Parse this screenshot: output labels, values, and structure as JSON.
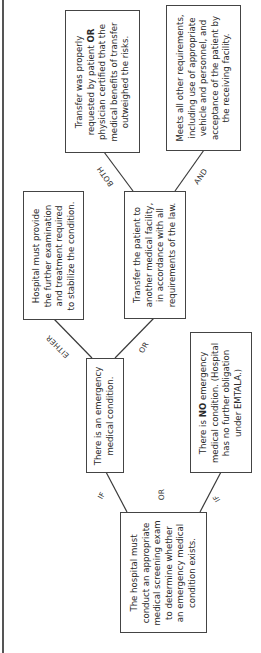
{
  "diagram": {
    "orientation": "rotated -90deg (reads bottom-to-top)",
    "nodes": {
      "screening": {
        "lines": [
          "The hospital must",
          "conduct an appropriate",
          "medical screening exam",
          "to determine whether",
          "an emergency medical",
          "condition exists."
        ]
      },
      "emergency": {
        "lines": [
          "There is an emergency",
          "medical condition."
        ]
      },
      "no_emergency": {
        "line1_pre": "There is ",
        "line1_bold": "NO",
        "line1_post": " emergency",
        "lines_rest": [
          "medical condition. (Hospital",
          "has no further obligation",
          "under EMTALA.)"
        ]
      },
      "stabilize": {
        "lines": [
          "Hospital must provide",
          "the further examination",
          "and treatment required",
          "to stabilize the condition."
        ]
      },
      "transfer": {
        "lines": [
          "Transfer the patient to",
          "another medical facility,",
          "in accordance with all",
          "requirements of the law."
        ]
      },
      "transfer_requested": {
        "line1": "Transfer was properly",
        "line2_pre": "requested by patient ",
        "line2_bold": "OR",
        "lines_rest": [
          "physician certified that the",
          "medical benefits of transfer",
          "outweighed the risks."
        ]
      },
      "other_requirements": {
        "lines": [
          "Meets all other requirements,",
          "including use of appropriate",
          "vehicle and personnel, and",
          "acceptance of the patient by",
          "the receiving facility."
        ]
      }
    },
    "edge_labels": {
      "if_emergency": "IF",
      "or_middle": "OR",
      "if_no_emergency": "IF",
      "either": "EITHER",
      "or_transfer": "OR",
      "both": "BOTH",
      "and": "AND"
    },
    "colors": {
      "border": "#444444",
      "line": "#3a3a3a",
      "text": "#2a2a2a"
    }
  }
}
